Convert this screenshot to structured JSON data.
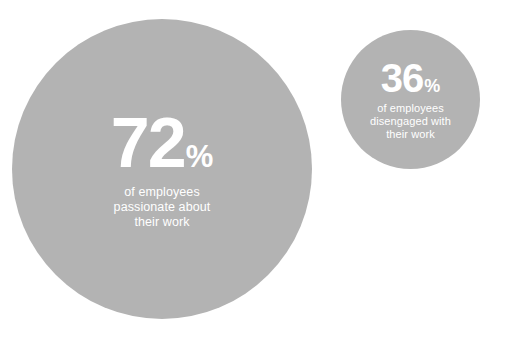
{
  "chart_data": {
    "type": "bubble",
    "title": "",
    "subtitle": "",
    "xlabel": "",
    "ylabel": "",
    "grid": false,
    "legend": "none",
    "unit": "%",
    "background_color": "#ffffff",
    "bubble_color": "#b3b3b3",
    "text_color": "#ffffff",
    "categories": [
      "of employees passionate about their work",
      "of employees disengaged with their work"
    ],
    "values": [
      72,
      36
    ],
    "series": [
      {
        "name": "Employee engagement",
        "values": [
          72,
          36
        ]
      }
    ],
    "bubbles": [
      {
        "id": "passionate",
        "value": 72,
        "value_text": "72",
        "unit": "%",
        "diameter_px": 300,
        "center": [
          162,
          169
        ],
        "caption_lines": [
          "of employees",
          "passionate about",
          "their work"
        ]
      },
      {
        "id": "disengaged",
        "value": 36,
        "value_text": "36",
        "unit": "%",
        "diameter_px": 139,
        "center": [
          410,
          100
        ],
        "caption_lines": [
          "of employees",
          "disengaged with",
          "their work"
        ]
      }
    ]
  },
  "bubbles": {
    "passionate": {
      "value_text": "72",
      "unit": "%",
      "caption_line_1": "of employees",
      "caption_line_2": "passionate about",
      "caption_line_3": "their work"
    },
    "disengaged": {
      "value_text": "36",
      "unit": "%",
      "caption_line_1": "of employees",
      "caption_line_2": "disengaged with",
      "caption_line_3": "their work"
    }
  },
  "colors": {
    "bubble_fill": "#b3b3b3",
    "text": "#ffffff",
    "background": "#ffffff"
  }
}
